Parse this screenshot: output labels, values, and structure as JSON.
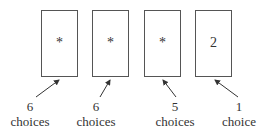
{
  "diagram": {
    "slots": [
      {
        "content": "*",
        "count": "6",
        "unit": "choices"
      },
      {
        "content": "*",
        "count": "6",
        "unit": "choices"
      },
      {
        "content": "*",
        "count": "5",
        "unit": "choices"
      },
      {
        "content": "2",
        "count": "1",
        "unit": "choice"
      }
    ]
  }
}
